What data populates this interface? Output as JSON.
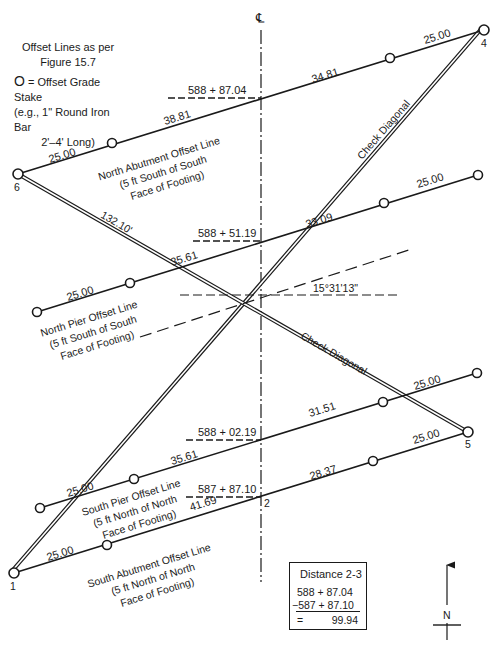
{
  "legend": {
    "line1": "Offset Lines as per",
    "line2": "Figure 15.7",
    "stake_symbol": "O",
    "stake_text": " = Offset Grade Stake",
    "line4": "(e.g., 1\" Round Iron Bar",
    "line5": "2'–4' Long)"
  },
  "centerline": {
    "symbol": "℄"
  },
  "points": {
    "p1": "1",
    "p2": "2",
    "p4": "4",
    "p5": "5",
    "p6": "6"
  },
  "offset_lines": {
    "north_abutment": {
      "name_1": "North Abutment Offset Line",
      "name_2": "(5 ft South of South",
      "name_3": "Face of Footing)",
      "station": "588 + 87.04",
      "dist_left_end": "25.00",
      "dist_left": "38.81",
      "dist_right": "34.81",
      "dist_right_end": "25.00"
    },
    "north_pier": {
      "name_1": "North Pier Offset Line",
      "name_2": "(5 ft South of South",
      "name_3": "Face of Footing)",
      "station": "588 + 51.19",
      "dist_left_end": "25.00",
      "dist_left": "35.61",
      "dist_right": "33.09",
      "dist_right_end": "25.00"
    },
    "south_pier": {
      "name_1": "South Pier Offset Line",
      "name_2": "(5 ft North of North",
      "name_3": "Face of Footing)",
      "station": "588 + 02.19",
      "dist_left_end": "25.00",
      "dist_left": "35.61",
      "dist_right": "31.51",
      "dist_right_end": "25.00"
    },
    "south_abutment": {
      "name_1": "South Abutment Offset Line",
      "name_2": "(5 ft North of North",
      "name_3": "Face of Footing)",
      "station": "587 + 87.10",
      "dist_left_end": "25.00",
      "dist_left": "41.69",
      "dist_right": "28.37",
      "dist_right_end": "25.00"
    }
  },
  "check_diagonals": {
    "label_1_4": "Check Diagonal",
    "label_6_5": "Check Diagonal",
    "length_6_5": "132.10'"
  },
  "skew_angle": "15°31'13\"",
  "distance_calc": {
    "title": "Distance 2-3",
    "station_a": "588 + 87.04",
    "station_b": "−587 + 87.10",
    "equals": "=",
    "result": "99.94"
  },
  "north_arrow": {
    "label": "N"
  },
  "colors": {
    "ink": "#1a1a1a",
    "background": "#ffffff"
  }
}
